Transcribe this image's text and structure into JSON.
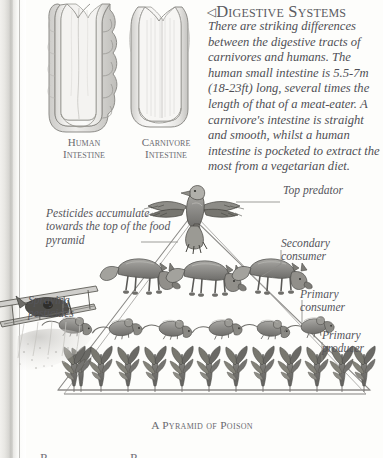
{
  "article": {
    "heading_marker": "◁",
    "heading": "Digestive Systems",
    "body": "There are striking differences between the digestive tracts of carnivores and humans. The human small intestine is 5.5-7m (18-23ft) long, several times the length of that of a meat-eater. A carnivore's intestine is straight and smooth, whilst a human intestine is pocketed to extract the most from a vegetarian diet."
  },
  "figures": {
    "human": {
      "caption_line1": "Human",
      "caption_line2": "Intestine",
      "icon": "human-intestine-illustration"
    },
    "carnivore": {
      "caption_line1": "Carnivore",
      "caption_line2": "Intestine",
      "icon": "carnivore-intestine-illustration"
    }
  },
  "pyramid": {
    "caption": "A Pyramid of Poison",
    "labels": {
      "accumulate": "Pesticides accumulate towards the top of the food pyramid",
      "spraying": "Spraying pesticides",
      "top_predator": "Top predator",
      "secondary_consumer": "Secondary consumer",
      "primary_consumer": "Primary consumer",
      "primary_producer": "Primary producer"
    },
    "tiers": [
      {
        "name": "top-predator",
        "organism": "eagle",
        "count": 1
      },
      {
        "name": "secondary-consumer",
        "organism": "fox",
        "count": 3
      },
      {
        "name": "primary-consumer",
        "organism": "mouse",
        "count": 6
      },
      {
        "name": "primary-producer",
        "organism": "corn-plant",
        "count": 12
      }
    ],
    "crop_duster": "biplane-spraying-pesticide"
  },
  "cutoff": {
    "text_a": "P",
    "text_b": "P"
  },
  "colors": {
    "paper": "#fdfdfb",
    "ink": "#4a4a50",
    "line": "#86868c",
    "gutter": "#bdbcb8"
  }
}
